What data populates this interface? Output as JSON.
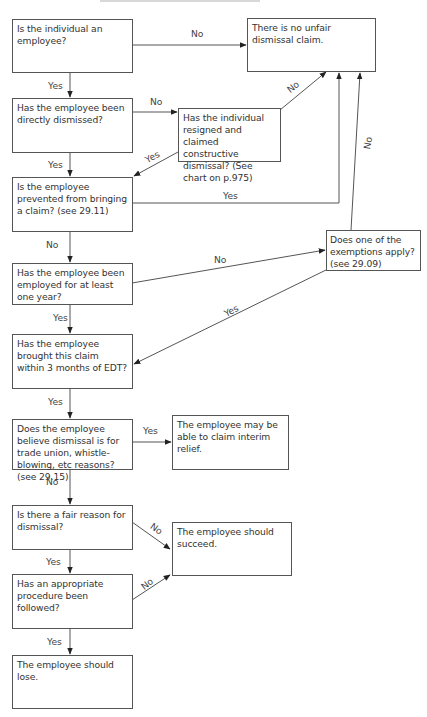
{
  "diagram": {
    "type": "flowchart",
    "subject": "Unfair dismissal claim",
    "nodes": {
      "q_employee": "Is the individual an employee?",
      "q_directly_dismissed": "Has the employee been directly dismissed?",
      "q_constructive": "Has the individual resigned and claimed constructive dismissal? (See chart on p.975)",
      "q_prevented": "Is the employee prevented from bringing a claim? (see 29.11)",
      "q_one_year": "Has the employee been employed for at least one year?",
      "q_exemptions": "Does one of the exemptions apply? (see 29.09)",
      "q_three_months": "Has the employee brought this claim within 3 months of EDT?",
      "q_trade_union": "Does the employee believe dismissal is for trade union, whistle-blowing, etc reasons? (see 29.15)",
      "r_interim": "The employee may be able to claim interim relief.",
      "q_fair_reason": "Is there a fair reason for dismissal?",
      "q_procedure": "Has an appropriate procedure been followed?",
      "r_no_claim": "There is no unfair dismissal claim.",
      "r_succeed": "The employee should succeed.",
      "r_lose": "The employee should lose."
    },
    "edges": [
      {
        "from": "q_employee",
        "to": "r_no_claim",
        "label": "No"
      },
      {
        "from": "q_employee",
        "to": "q_directly_dismissed",
        "label": "Yes"
      },
      {
        "from": "q_directly_dismissed",
        "to": "q_constructive",
        "label": "No"
      },
      {
        "from": "q_directly_dismissed",
        "to": "q_prevented",
        "label": "Yes"
      },
      {
        "from": "q_constructive",
        "to": "r_no_claim",
        "label": "No"
      },
      {
        "from": "q_constructive",
        "to": "q_prevented",
        "label": "Yes"
      },
      {
        "from": "q_prevented",
        "to": "r_no_claim",
        "label": "Yes"
      },
      {
        "from": "q_prevented",
        "to": "q_one_year",
        "label": "No"
      },
      {
        "from": "q_one_year",
        "to": "q_exemptions",
        "label": "No"
      },
      {
        "from": "q_one_year",
        "to": "q_three_months",
        "label": "Yes"
      },
      {
        "from": "q_exemptions",
        "to": "r_no_claim",
        "label": "No"
      },
      {
        "from": "q_exemptions",
        "to": "q_three_months",
        "label": "Yes"
      },
      {
        "from": "q_three_months",
        "to": "q_trade_union",
        "label": "Yes"
      },
      {
        "from": "q_trade_union",
        "to": "r_interim",
        "label": "Yes"
      },
      {
        "from": "q_trade_union",
        "to": "q_fair_reason",
        "label": "No"
      },
      {
        "from": "q_fair_reason",
        "to": "r_succeed",
        "label": "No"
      },
      {
        "from": "q_fair_reason",
        "to": "q_procedure",
        "label": "Yes"
      },
      {
        "from": "q_procedure",
        "to": "r_succeed",
        "label": "No"
      },
      {
        "from": "q_procedure",
        "to": "r_lose",
        "label": "Yes"
      }
    ],
    "labels": {
      "yes": "Yes",
      "no": "No"
    }
  }
}
